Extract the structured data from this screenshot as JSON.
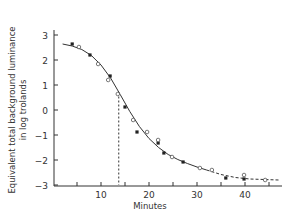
{
  "chart_data": {
    "type": "scatter",
    "title": "",
    "xlabel": "Minutes",
    "ylabel": "Equivalent total background luminance in log trolands",
    "ylabel_lines": [
      "Equivalent total background luminance",
      "in log trolands"
    ],
    "xlim": [
      0,
      48
    ],
    "ylim": [
      -3,
      3.4
    ],
    "x_ticks": [
      5,
      10,
      15,
      20,
      25,
      30,
      35,
      40,
      45
    ],
    "x_tick_labels": [
      "10",
      "20",
      "30",
      "40"
    ],
    "x_tick_label_values": [
      10,
      20,
      30,
      40
    ],
    "y_ticks": [
      3,
      2,
      1,
      0,
      -1,
      -2,
      -3
    ],
    "y_tick_labels": [
      "3",
      "2",
      "1",
      "0",
      "−1",
      "−2",
      "−3"
    ],
    "grid": false,
    "legend": null,
    "annotations": [
      {
        "type": "vertical-dashed-line",
        "x": 13.7,
        "y_from": -3,
        "y_to": 0.7
      }
    ],
    "series": [
      {
        "name": "filled-points",
        "marker": "filled-square",
        "x": [
          4.0,
          7.7,
          11.9,
          15.0,
          17.5,
          21.9,
          23.1,
          27.1,
          36.0,
          39.8
        ],
        "y": [
          2.64,
          2.2,
          1.36,
          0.12,
          -0.88,
          -1.32,
          -1.72,
          -2.08,
          -2.72,
          -2.76
        ]
      },
      {
        "name": "open-points",
        "marker": "open-circle",
        "x": [
          5.4,
          9.4,
          11.5,
          13.5,
          16.7,
          19.6,
          21.9,
          24.8,
          30.6,
          33.1,
          39.8,
          44.2
        ],
        "y": [
          2.52,
          1.84,
          1.2,
          0.64,
          -0.4,
          -0.88,
          -1.2,
          -1.88,
          -2.32,
          -2.4,
          -2.6,
          -2.8
        ]
      },
      {
        "name": "fitted-curve",
        "style": "solid-line",
        "x": [
          2,
          4,
          6,
          8,
          10,
          12,
          14,
          16,
          18,
          20,
          22,
          24,
          26,
          28,
          30,
          32
        ],
        "y": [
          2.64,
          2.56,
          2.42,
          2.18,
          1.8,
          1.28,
          0.62,
          -0.06,
          -0.66,
          -1.14,
          -1.5,
          -1.78,
          -1.98,
          -2.14,
          -2.28,
          -2.4
        ]
      },
      {
        "name": "fitted-curve-extrapolated",
        "style": "dashed-line",
        "x": [
          32,
          35,
          38,
          41,
          44,
          47
        ],
        "y": [
          -2.4,
          -2.58,
          -2.7,
          -2.76,
          -2.78,
          -2.8
        ]
      }
    ]
  }
}
